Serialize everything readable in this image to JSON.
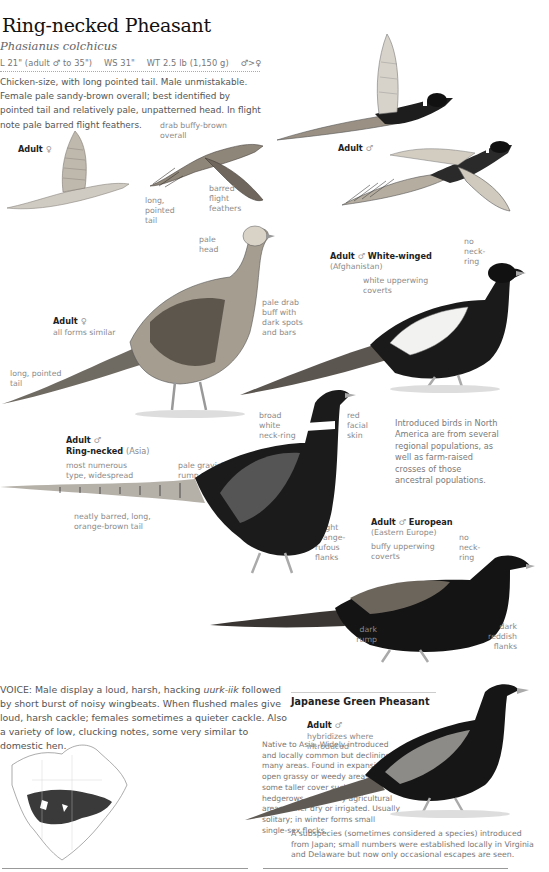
{
  "header": {
    "title": "Ring-necked Pheasant",
    "scientific_name": "Phasianus colchicus",
    "measurements": {
      "length": "L 21\" (adult ♂ to 35\")",
      "wingspan": "WS 31\"",
      "weight": "WT 2.5 lb (1,150 g)",
      "size_note": "♂>♀"
    },
    "description": "Chicken-size, with long pointed tail. Male unmistakable. Female pale sandy-brown overall; best identified by pointed tail and relatively pale, unpatterned head. In flight note pale barred flight feathers."
  },
  "flight_figures": {
    "female": {
      "label": "Adult",
      "sex_symbol": "♀",
      "annotations": [
        "drab buffy-brown overall",
        "long, pointed tail",
        "barred flight feathers"
      ]
    },
    "male": {
      "label": "Adult",
      "sex_symbol": "♂"
    }
  },
  "female_standing": {
    "label": "Adult",
    "sex_symbol": "♀",
    "sublabel": "all forms similar",
    "annotations": [
      "pale head",
      "pale drab buff with dark spots and bars",
      "long, pointed tail"
    ]
  },
  "white_winged": {
    "label": "Adult",
    "sex_symbol": "♂",
    "form": "White-winged",
    "region": "(Afghanistan)",
    "annotations": [
      "white upperwing coverts",
      "no neck-ring"
    ]
  },
  "ring_necked": {
    "label": "Adult",
    "sex_symbol": "♂",
    "form": "Ring-necked",
    "region": "(Asia)",
    "sublabel": "most numerous type, widespread",
    "annotations": [
      "pale grayish rump",
      "broad white neck-ring",
      "red facial skin",
      "neatly barred, long, orange-brown tail",
      "bright orange-rufous flanks"
    ]
  },
  "introduced_note": "Introduced birds in North America are from several regional populations, as well as farm-raised crosses of those ancestral populations.",
  "european": {
    "label": "Adult",
    "sex_symbol": "♂",
    "form": "European",
    "region": "(Eastern Europe)",
    "annotations": [
      "buffy upperwing coverts",
      "no neck-ring",
      "dark rump",
      "dark reddish flanks"
    ]
  },
  "voice": {
    "heading": "VOICE:",
    "text_1": "Male display a loud, harsh, hacking",
    "call": "uurk-iik",
    "text_2": "followed by short burst of noisy wingbeats. When flushed males give loud, harsh cackle; females sometimes a quieter cackle. Also a variety of low, clucking notes, some very similar to domestic hen."
  },
  "range_text": "Native to Asia. Widely introduced and locally common but declining in many areas. Found in expansive open grassy or weedy areas with some taller cover such as hedgerows, especially agricultural areas either dry or irrigated. Usually solitary; in winter forms small single-sex flocks.",
  "japanese_green": {
    "title": "Japanese Green Pheasant",
    "label": "Adult",
    "sex_symbol": "♂",
    "sublabel": "hybridizes where introduced",
    "note": "A subspecies (sometimes considered a species) introduced from Japan; small numbers were established locally in Virginia and Delaware but now only occasional escapes are seen."
  },
  "colors": {
    "ink_dark": "#1a1a1a",
    "text_gray": "#8a8a8a",
    "range_fill": "#3a3a3a",
    "female_buff": "#b9b2a6"
  }
}
